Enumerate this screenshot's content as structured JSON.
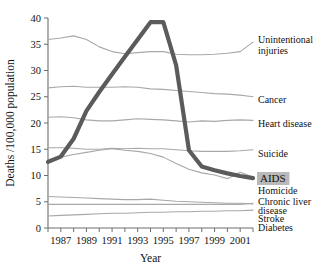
{
  "chart_data": {
    "type": "line",
    "title": "",
    "xlabel": "Year",
    "ylabel": "Deaths /100,000 population",
    "xlim": [
      1986,
      2002
    ],
    "ylim": [
      0,
      40
    ],
    "ytick_step": 5,
    "yticks": [
      0,
      5,
      10,
      15,
      20,
      25,
      30,
      35,
      40
    ],
    "ytick_labels": [
      "0",
      "5",
      "10",
      "15",
      "20",
      "25",
      "30",
      "35",
      "40"
    ],
    "xticks": [
      1986,
      1987,
      1988,
      1989,
      1990,
      1991,
      1992,
      1993,
      1994,
      1995,
      1996,
      1997,
      1998,
      1999,
      2000,
      2001,
      2002
    ],
    "xtick_labels": [
      "",
      "1987",
      "",
      "1989",
      "",
      "1991",
      "",
      "1993",
      "",
      "1995",
      "",
      "1997",
      "",
      "1999",
      "",
      "2001",
      ""
    ],
    "grid": false,
    "legend_position": "right-inline",
    "x": [
      1986,
      1987,
      1988,
      1989,
      1990,
      1991,
      1992,
      1993,
      1994,
      1995,
      1996,
      1997,
      1998,
      1999,
      2000,
      2001,
      2002
    ],
    "series": [
      {
        "name": "Unintentional injuries",
        "label": "Unintentional injuries",
        "highlight": false,
        "color": "#a8a8a8",
        "label_y": 35.3,
        "values": [
          35.9,
          36.2,
          36.6,
          35.9,
          34.5,
          33.6,
          33.2,
          33.4,
          33.6,
          33.6,
          33.1,
          33.0,
          33.0,
          33.1,
          33.3,
          33.6,
          35.4
        ]
      },
      {
        "name": "Cancer",
        "label": "Cancer",
        "highlight": false,
        "color": "#a8a8a8",
        "label_y": 24.8,
        "values": [
          26.7,
          26.9,
          27.0,
          26.8,
          26.8,
          26.8,
          26.9,
          26.8,
          26.5,
          26.4,
          26.2,
          26.0,
          25.8,
          25.6,
          25.5,
          25.3,
          25.0
        ]
      },
      {
        "name": "Heart disease",
        "label": "Heart disease",
        "highlight": false,
        "color": "#a8a8a8",
        "label_y": 20.5,
        "values": [
          21.1,
          21.2,
          21.0,
          20.6,
          20.4,
          20.4,
          20.6,
          20.8,
          20.7,
          20.6,
          20.4,
          20.2,
          20.4,
          20.3,
          20.5,
          20.6,
          20.5
        ]
      },
      {
        "name": "Suicide",
        "label": "Suicide",
        "highlight": false,
        "color": "#a8a8a8",
        "label_y": 14.9,
        "values": [
          15.3,
          15.3,
          15.2,
          15.0,
          15.0,
          15.2,
          15.1,
          15.2,
          15.1,
          15.1,
          14.9,
          14.7,
          14.6,
          14.6,
          14.6,
          14.7,
          14.9
        ]
      },
      {
        "name": "Homicide",
        "label": "Homicide",
        "highlight": false,
        "color": "#a8a8a8",
        "label_y": 11.3,
        "values": [
          13.0,
          13.5,
          14.0,
          14.4,
          14.8,
          15.1,
          14.8,
          14.6,
          14.2,
          13.5,
          12.3,
          11.2,
          10.5,
          10.1,
          9.4,
          10.6,
          9.7
        ]
      },
      {
        "name": "Chronic liver disease",
        "label": "Chronic liver disease",
        "highlight": false,
        "color": "#a8a8a8",
        "label_y": 5.8,
        "values": [
          6.0,
          5.9,
          5.8,
          5.7,
          5.6,
          5.5,
          5.4,
          5.4,
          5.5,
          5.3,
          5.1,
          5.0,
          4.9,
          4.8,
          4.7,
          4.7,
          4.6
        ]
      },
      {
        "name": "Stroke",
        "label": "Stroke",
        "highlight": false,
        "color": "#a8a8a8",
        "label_y": 4.0,
        "values": [
          4.5,
          4.5,
          4.5,
          4.5,
          4.5,
          4.5,
          4.5,
          4.5,
          4.5,
          4.5,
          4.5,
          4.5,
          4.5,
          4.5,
          4.5,
          4.5,
          4.7
        ]
      },
      {
        "name": "Diabetes",
        "label": "Diabetes",
        "highlight": false,
        "color": "#a8a8a8",
        "label_y": 2.6,
        "values": [
          2.3,
          2.4,
          2.5,
          2.6,
          2.7,
          2.8,
          2.8,
          2.9,
          3.0,
          3.0,
          3.1,
          3.1,
          3.2,
          3.2,
          3.3,
          3.3,
          3.4
        ]
      },
      {
        "name": "AIDS",
        "label": "AIDS",
        "highlight": true,
        "color": "#5b5b5b",
        "label_y": 10.2,
        "values": [
          12.6,
          13.6,
          17.0,
          22.3,
          25.9,
          29.3,
          32.6,
          35.9,
          39.2,
          39.2,
          31.0,
          14.8,
          11.7,
          11.0,
          10.4,
          9.9,
          9.5
        ]
      }
    ],
    "labels_right": [
      {
        "text": "Unintentional",
        "x": 258,
        "y": 43
      },
      {
        "text": "injuries",
        "x": 258,
        "y": 54
      },
      {
        "text": "Cancer",
        "x": 258,
        "y": 103
      },
      {
        "text": "Heart disease",
        "x": 258,
        "y": 127
      },
      {
        "text": "Suicide",
        "x": 258,
        "y": 157
      },
      {
        "text": "AIDS",
        "x": 260,
        "y": 182,
        "boxed": true
      },
      {
        "text": "Homicide",
        "x": 258,
        "y": 194
      },
      {
        "text": "Chronic liver",
        "x": 258,
        "y": 205
      },
      {
        "text": "disease",
        "x": 258,
        "y": 214
      },
      {
        "text": "Stroke",
        "x": 258,
        "y": 222
      },
      {
        "text": "Diabetes",
        "x": 258,
        "y": 231
      }
    ],
    "highlight_box_color": "#b9b9b9"
  }
}
